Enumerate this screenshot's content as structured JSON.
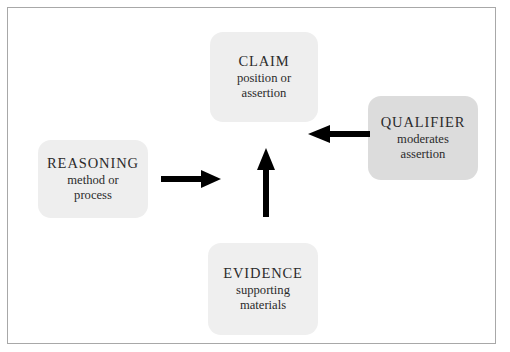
{
  "diagram": {
    "background_color": "#ffffff",
    "border_color": "#a8a8a8",
    "arrow_color": "#000000",
    "nodes": [
      {
        "id": "claim",
        "title": "CLAIM",
        "subtitle_line1": "position or",
        "subtitle_line2": "assertion",
        "fill": "#eeeeee"
      },
      {
        "id": "qualifier",
        "title": "QUALIFIER",
        "subtitle_line1": "moderates",
        "subtitle_line2": "assertion",
        "fill": "#dcdcdc"
      },
      {
        "id": "reasoning",
        "title": "REASONING",
        "subtitle_line1": "method or",
        "subtitle_line2": "process",
        "fill": "#eeeeee"
      },
      {
        "id": "evidence",
        "title": "EVIDENCE",
        "subtitle_line1": "supporting",
        "subtitle_line2": "materials",
        "fill": "#efefef"
      }
    ],
    "arrows": [
      {
        "id": "reasoning-to-claim",
        "direction": "right"
      },
      {
        "id": "evidence-to-claim",
        "direction": "up"
      },
      {
        "id": "qualifier-to-claim",
        "direction": "left"
      }
    ]
  }
}
